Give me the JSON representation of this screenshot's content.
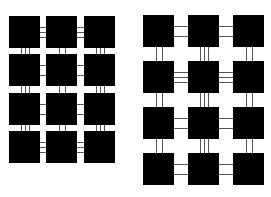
{
  "figure": {
    "colors": {
      "tile": "#000000",
      "connector": "#555555",
      "background": "#ffffff"
    },
    "grids": [
      {
        "name": "left-grid",
        "cols_x": [
          9,
          46,
          84
        ],
        "rows_y": [
          16,
          54,
          93,
          131
        ],
        "size": 31,
        "h_links": [
          [
            3,
            3
          ],
          [
            2,
            2
          ],
          [
            2,
            2
          ],
          [
            3,
            3
          ]
        ],
        "v_links": [
          [
            3,
            2,
            3
          ],
          [
            3,
            2,
            3
          ],
          [
            3,
            2,
            3
          ]
        ]
      },
      {
        "name": "right-grid",
        "cols_x": [
          143,
          188,
          233
        ],
        "rows_y": [
          15,
          61,
          107,
          153
        ],
        "size": 31,
        "h_links": [
          [
            2,
            2
          ],
          [
            3,
            3
          ],
          [
            2,
            2
          ],
          [
            2,
            2
          ]
        ],
        "v_links": [
          [
            2,
            3,
            2
          ],
          [
            2,
            3,
            2
          ],
          [
            2,
            3,
            2
          ]
        ]
      }
    ]
  }
}
